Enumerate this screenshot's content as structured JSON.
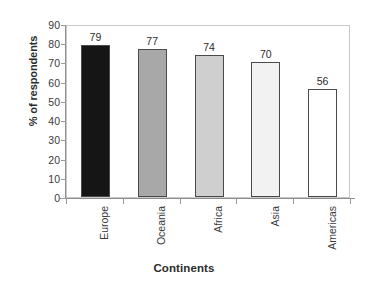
{
  "chart_data": {
    "type": "bar",
    "title": "",
    "xlabel": "Continents",
    "ylabel": "% of respondents",
    "categories": [
      "Europe",
      "Oceania",
      "Africa",
      "Asia",
      "Americas"
    ],
    "values": [
      79,
      77,
      74,
      70,
      56
    ],
    "value_labels": [
      "79",
      "77",
      "74",
      "70",
      "56"
    ],
    "ylim": [
      0,
      90
    ],
    "ytick_labels": [
      "90",
      "80",
      "70",
      "60",
      "50",
      "40",
      "30",
      "20",
      "10",
      "0"
    ],
    "ytick_values": [
      90,
      80,
      70,
      60,
      50,
      40,
      30,
      20,
      10,
      0
    ],
    "grid": false,
    "legend": "none",
    "bar_colors": [
      "#151515",
      "#a8a8a8",
      "#cfcfcf",
      "#f2f2f2",
      "#ffffff"
    ],
    "bar_edge_color": "#4a4a4a",
    "axis_color": "#8d8d8d",
    "plot_border_color": "#c9c9c9",
    "background_color": "#ffffff",
    "text_color": "#2b2b2b"
  }
}
